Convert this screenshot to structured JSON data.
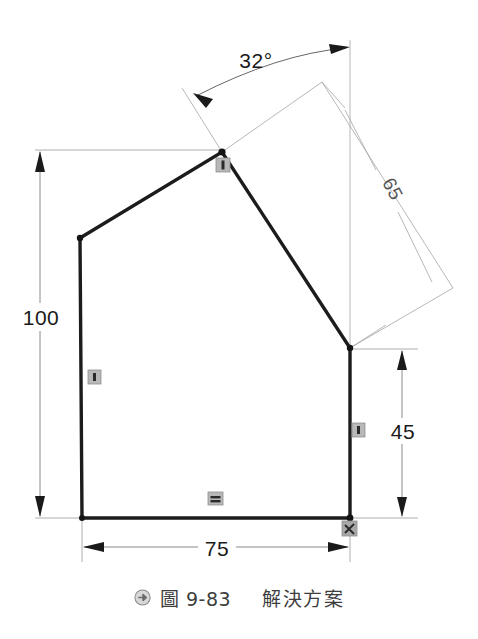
{
  "drawing": {
    "title_caption": {
      "icon": "arrow-bullet-icon",
      "figure_label": "圖 9-83",
      "figure_title": "解決方案"
    },
    "dimensions": [
      {
        "id": "height-100",
        "value": "100",
        "kind": "linear-vertical"
      },
      {
        "id": "width-75",
        "value": "75",
        "kind": "linear-horizontal"
      },
      {
        "id": "height-45",
        "value": "45",
        "kind": "linear-vertical"
      },
      {
        "id": "angle-32",
        "value": "32°",
        "kind": "angular"
      },
      {
        "id": "length-65",
        "value": "65",
        "kind": "linear-aligned"
      }
    ],
    "constraints": [
      {
        "id": "coincident-apex",
        "glyph": "vertical-bar"
      },
      {
        "id": "vertical-left-edge",
        "glyph": "vertical-bar"
      },
      {
        "id": "vertical-right-edge",
        "glyph": "vertical-bar"
      },
      {
        "id": "horizontal-bottom-edge",
        "glyph": "horizontal-bars"
      },
      {
        "id": "fixed-origin",
        "glyph": "anchor-cross"
      }
    ],
    "colors": {
      "geometry": "#1c1c1c",
      "dimension": "#555555",
      "construction": "#9a9a9a",
      "constraint_badge": "#8c8c8c",
      "background": "#ffffff",
      "caption": "#3d3d3d"
    },
    "profile": {
      "name": "pentagon-profile",
      "vertices": [
        {
          "name": "bottom-left",
          "x": 82,
          "y": 518
        },
        {
          "name": "top-left",
          "x": 80,
          "y": 238
        },
        {
          "name": "apex",
          "x": 222,
          "y": 152
        },
        {
          "name": "right-shoulder",
          "x": 350,
          "y": 348
        },
        {
          "name": "bottom-right",
          "x": 350,
          "y": 518
        }
      ]
    }
  }
}
